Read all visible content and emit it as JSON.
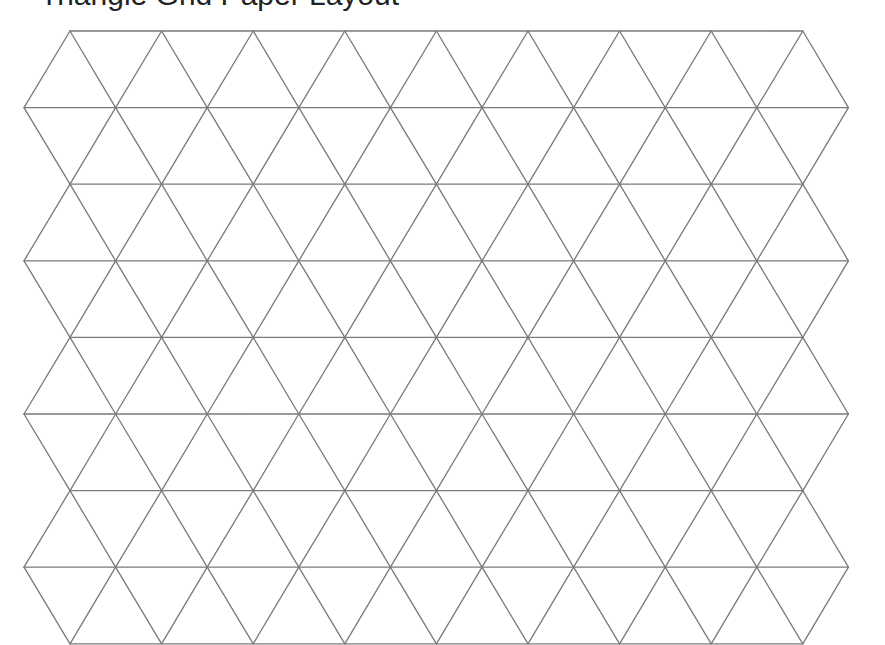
{
  "page": {
    "title": "Triangle Grid Paper Layout"
  },
  "grid": {
    "type": "isometric-triangle-grid",
    "rows": 8,
    "top_y": 31,
    "row_height": 76.6,
    "even_row_start_x": 70,
    "odd_row_start_x": 24,
    "spacing_x": 91.6,
    "even_row_vertices": 9,
    "odd_row_vertices": 10,
    "line_color": "#7a7a7a",
    "line_width": 1.3,
    "background": "#ffffff"
  }
}
